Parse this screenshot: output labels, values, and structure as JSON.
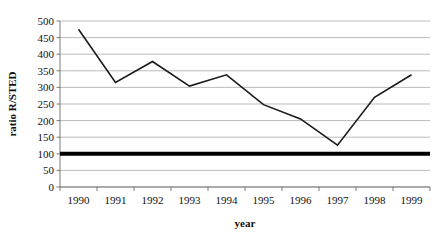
{
  "chart_data": {
    "type": "line",
    "title": "",
    "xlabel": "year",
    "ylabel": "ratio R/STED",
    "categories": [
      "1990",
      "1991",
      "1992",
      "1993",
      "1994",
      "1995",
      "1996",
      "1997",
      "1998",
      "1999"
    ],
    "x": [
      1990,
      1991,
      1992,
      1993,
      1994,
      1995,
      1996,
      1997,
      1998,
      1999
    ],
    "series": [
      {
        "name": "ratio R/STED",
        "values": [
          475,
          315,
          378,
          304,
          338,
          248,
          205,
          126,
          270,
          338
        ],
        "color": "#1a1a1a"
      }
    ],
    "reference_line": {
      "name": "reference",
      "value": 100,
      "color": "#000000",
      "width": 4
    },
    "ylim": [
      0,
      500
    ],
    "ytick_labels": [
      "0",
      "50",
      "100",
      "150",
      "200",
      "250",
      "300",
      "350",
      "400",
      "450",
      "500"
    ],
    "yticks": [
      0,
      50,
      100,
      150,
      200,
      250,
      300,
      350,
      400,
      450,
      500
    ],
    "grid": true,
    "grid_axis": "y",
    "grid_color": "#9e9e9e",
    "legend": false,
    "legend_position": "none",
    "background": "#ffffff",
    "plot_area": {
      "left": 60,
      "top": 21,
      "right": 430,
      "bottom": 187
    }
  }
}
